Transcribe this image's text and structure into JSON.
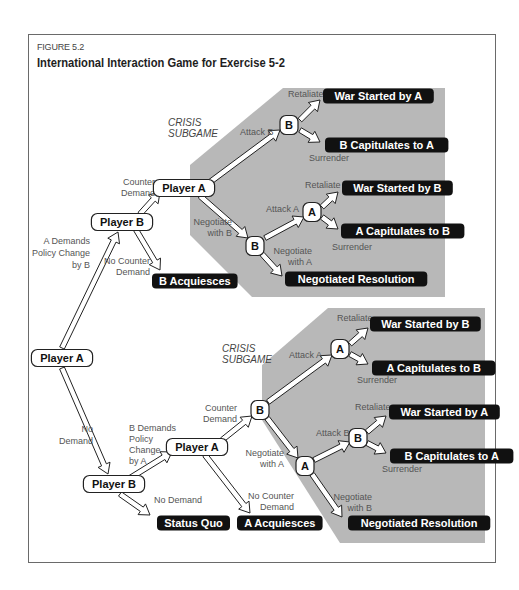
{
  "figure": {
    "label": "FIGURE 5.2",
    "title": "International Interaction Game for Exercise 5-2"
  },
  "colors": {
    "shade": "#b8b8b8",
    "outcome_bg": "#111111",
    "node_bg": "#ffffff"
  },
  "regions": {
    "crisis_top": [
      "CRISIS",
      "SUBGAME"
    ],
    "crisis_bottom": [
      "CRISIS",
      "SUBGAME"
    ]
  },
  "nodes": {
    "root": "Player A",
    "b1": "Player B",
    "a1": "Player A",
    "b_crisis1": "B",
    "b_neg1": "B",
    "a_crisis1": "A",
    "b2": "Player B",
    "a2": "Player A",
    "b_counter2": "B",
    "a_crisis2": "A",
    "a_neg2": "A",
    "b_crisis2": "B"
  },
  "outcomes": {
    "war_a_1": "War Started by A",
    "b_cap_1": "B Capitulates to A",
    "war_b_1": "War Started by B",
    "a_cap_1": "A Capitulates to B",
    "neg_1": "Negotiated Resolution",
    "b_acq": "B Acquiesces",
    "war_b_2": "War Started by B",
    "a_cap_2": "A Capitulates to B",
    "war_a_2": "War Started by A",
    "b_cap_2": "B Capitulates to A",
    "neg_2": "Negotiated Resolution",
    "status_quo": "Status Quo",
    "a_acq": "A Acquiesces"
  },
  "edges": {
    "a_demands": [
      "A Demands",
      "Policy Change",
      "by B"
    ],
    "no_demand": [
      "No",
      "Demand"
    ],
    "counter_demand_1": [
      "Counter",
      "Demand"
    ],
    "no_counter_1": [
      "No Counter",
      "Demand"
    ],
    "attack_b_1": "Attack B",
    "negotiate_b_1": [
      "Negotiate",
      "with B"
    ],
    "retaliate_1a": "Retaliate",
    "surrender_1a": "Surrender",
    "attack_a_1": "Attack A",
    "negotiate_a_1": [
      "Negotiate",
      "with A"
    ],
    "retaliate_1b": "Retaliate",
    "surrender_1b": "Surrender",
    "b_demands": [
      "B Demands",
      "Policy",
      "Change",
      "by A"
    ],
    "no_demand_2": "No Demand",
    "counter_demand_2": [
      "Counter",
      "Demand"
    ],
    "no_counter_2": [
      "No Counter",
      "Demand"
    ],
    "attack_a_2": "Attack A",
    "negotiate_a_2": [
      "Negotiate",
      "with A"
    ],
    "retaliate_2a": "Retaliate",
    "surrender_2a": "Surrender",
    "attack_b_2": "Attack B",
    "negotiate_b_2": [
      "Negotiate",
      "with B"
    ],
    "retaliate_2b": "Retaliate",
    "surrender_2b": "Surrender"
  }
}
